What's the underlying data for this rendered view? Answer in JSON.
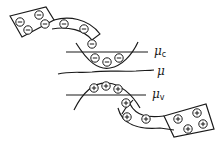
{
  "diagram": {
    "type": "energy-level schematic",
    "colors": {
      "stroke": "#1a1a1a",
      "background": "#ffffff"
    },
    "levels": [
      {
        "id": "mu_c",
        "symbol": "μ",
        "subscript": "c",
        "y": 52
      },
      {
        "id": "mu",
        "symbol": "μ",
        "subscript": "",
        "y": 72
      },
      {
        "id": "mu_v",
        "symbol": "μ",
        "subscript": "v",
        "y": 95
      }
    ],
    "reservoirs": [
      {
        "id": "electron-reservoir",
        "position": "top-left",
        "carrier": "electron",
        "glyph": "⊖",
        "count": 4
      },
      {
        "id": "hole-reservoir",
        "position": "bottom-right",
        "carrier": "hole",
        "glyph": "⊕",
        "count": 4
      }
    ],
    "channels": [
      {
        "id": "electron-channel",
        "carrier": "electron",
        "glyph": "⊖",
        "count": 3
      },
      {
        "id": "hole-channel",
        "carrier": "hole",
        "glyph": "⊕",
        "count": 3
      }
    ],
    "bands": [
      {
        "id": "conduction-band-well",
        "carrier": "electron",
        "glyph": "⊖",
        "count": 3
      },
      {
        "id": "valence-band-hill",
        "carrier": "hole",
        "glyph": "⊕",
        "count": 3
      }
    ]
  }
}
